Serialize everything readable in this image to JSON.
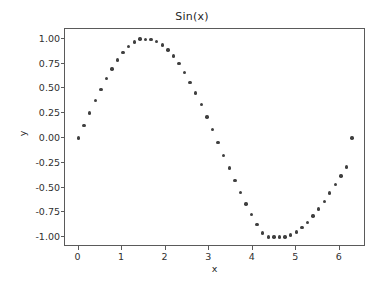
{
  "chart_data": {
    "type": "scatter",
    "title": "Sin(x)",
    "xlabel": "x",
    "ylabel": "y",
    "xlim": [
      -0.31,
      6.6
    ],
    "ylim": [
      -1.1,
      1.1
    ],
    "grid": false,
    "legend": null,
    "marker": {
      "shape": "circle",
      "color": "#3f3f3f",
      "size": 3.4
    },
    "xticks": [
      0,
      1,
      2,
      3,
      4,
      5,
      6
    ],
    "xtick_labels": [
      "0",
      "1",
      "2",
      "3",
      "4",
      "5",
      "6"
    ],
    "yticks": [
      1.0,
      0.75,
      0.5,
      0.25,
      0.0,
      -0.25,
      -0.5,
      -0.75,
      -1.0
    ],
    "ytick_labels": [
      "1.00",
      "0.75",
      "0.50",
      "0.25",
      "0.00",
      "-0.25",
      "-0.50",
      "-0.75",
      "-1.00"
    ],
    "series": [
      {
        "name": "sin(x)",
        "x": [
          0.0,
          0.12819,
          0.25637,
          0.38456,
          0.51275,
          0.64094,
          0.76912,
          0.89731,
          1.0255,
          1.15368,
          1.28187,
          1.41006,
          1.53825,
          1.66643,
          1.79462,
          1.92281,
          2.05099,
          2.17918,
          2.30737,
          2.43556,
          2.56374,
          2.69193,
          2.82012,
          2.9483,
          3.07649,
          3.20468,
          3.33287,
          3.46105,
          3.58924,
          3.71743,
          3.84561,
          3.9738,
          4.10199,
          4.23018,
          4.35836,
          4.48655,
          4.61474,
          4.74292,
          4.87111,
          4.9993,
          5.12749,
          5.25567,
          5.38386,
          5.51205,
          5.64023,
          5.76842,
          5.89661,
          6.0248,
          6.15298,
          6.28117
        ],
        "y": [
          0.0,
          0.12783,
          0.25365,
          0.37549,
          0.49139,
          0.59951,
          0.6981,
          0.78558,
          0.86055,
          0.92182,
          0.96841,
          0.99958,
          0.99486,
          0.99572,
          0.97493,
          0.93937,
          0.88941,
          0.82565,
          0.74895,
          0.66032,
          0.56096,
          0.45226,
          0.33571,
          0.21297,
          0.08579,
          -0.04399,
          -0.17453,
          -0.30394,
          -0.43039,
          -0.55206,
          -0.66722,
          -0.77425,
          -0.87166,
          -0.9581,
          -1.0,
          -1.0,
          -1.0,
          -0.99914,
          -0.97905,
          -0.9471,
          -0.90397,
          -0.85052,
          -0.78782,
          -0.71707,
          -0.63961,
          -0.5569,
          -0.47049,
          -0.38199,
          -0.29305,
          -0.00035
        ]
      }
    ]
  }
}
